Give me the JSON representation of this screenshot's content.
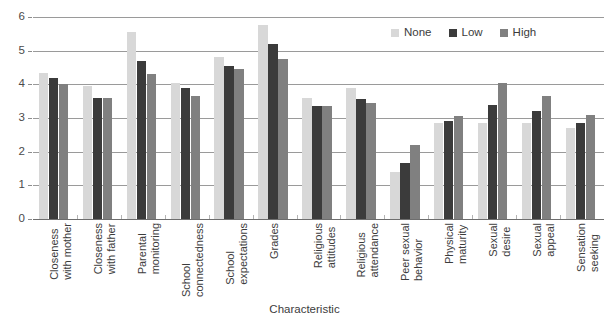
{
  "chart_data": {
    "type": "bar",
    "title": "",
    "xlabel": "Characteristic",
    "ylabel": "",
    "ylim": [
      0,
      6
    ],
    "yticks": [
      0,
      1,
      2,
      3,
      4,
      5,
      6
    ],
    "grid": true,
    "legend_position": "top-right",
    "categories": [
      "Closeness with mother",
      "Closeness with father",
      "Parental monitoring",
      "School connectedness",
      "School expectations",
      "Grades",
      "Religious attitudes",
      "Religious attendance",
      "Peer sexual behavior",
      "Physical maturity",
      "Sexual desire",
      "Sexual appeal",
      "Sensation seeking"
    ],
    "category_lines": [
      [
        "Closeness",
        "with mother"
      ],
      [
        "Closeness",
        "with father"
      ],
      [
        "Parental",
        "monitoring"
      ],
      [
        "School",
        "connectedness"
      ],
      [
        "School",
        "expectations"
      ],
      [
        "Grades",
        ""
      ],
      [
        "Religious",
        "attitudes"
      ],
      [
        "Religious",
        "attendance"
      ],
      [
        "Peer sexual",
        "behavior"
      ],
      [
        "Physical",
        "maturity"
      ],
      [
        "Sexual",
        "desire"
      ],
      [
        "Sexual",
        "appeal"
      ],
      [
        "Sensation",
        "seeking"
      ]
    ],
    "series": [
      {
        "name": "None",
        "color": "#d8d8d8",
        "values": [
          4.35,
          3.95,
          5.55,
          4.05,
          4.8,
          5.75,
          3.6,
          3.9,
          1.4,
          2.85,
          2.85,
          2.85,
          2.7
        ]
      },
      {
        "name": "Low",
        "color": "#3b3b3b",
        "values": [
          4.2,
          3.6,
          4.7,
          3.9,
          4.55,
          5.2,
          3.35,
          3.55,
          1.65,
          2.9,
          3.4,
          3.2,
          2.85
        ]
      },
      {
        "name": "High",
        "color": "#808080",
        "values": [
          4.0,
          3.6,
          4.3,
          3.65,
          4.45,
          4.75,
          3.35,
          3.45,
          2.2,
          3.05,
          4.05,
          3.65,
          3.1
        ]
      }
    ]
  },
  "legend": {
    "items": [
      {
        "label": "None",
        "color": "#d8d8d8"
      },
      {
        "label": "Low",
        "color": "#3b3b3b"
      },
      {
        "label": "High",
        "color": "#808080"
      }
    ]
  },
  "axis": {
    "x_title": "Characteristic",
    "y_tick_labels": [
      "0",
      "1",
      "2",
      "3",
      "4",
      "5",
      "6"
    ]
  }
}
